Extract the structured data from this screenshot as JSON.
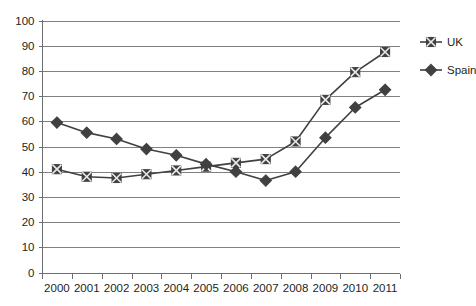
{
  "chart_data": {
    "type": "line",
    "title": "",
    "subtitle": "",
    "xlabel": "",
    "ylabel": "",
    "categories": [
      "2000",
      "2001",
      "2002",
      "2003",
      "2004",
      "2005",
      "2006",
      "2007",
      "2008",
      "2009",
      "2010",
      "2011"
    ],
    "series": [
      {
        "name": "UK",
        "marker": "square",
        "color": "#404040",
        "values": [
          41,
          38,
          37.5,
          39,
          40.5,
          42,
          43.5,
          45,
          52,
          68.5,
          79.5,
          87.5
        ]
      },
      {
        "name": "Spain",
        "marker": "diamond",
        "color": "#404040",
        "values": [
          59.5,
          55.5,
          53,
          49,
          46.5,
          43,
          40,
          36.5,
          40,
          53.5,
          65.5,
          72.5
        ]
      }
    ],
    "ylim": [
      0,
      100
    ],
    "y_ticks": [
      "0",
      "10",
      "20",
      "30",
      "40",
      "50",
      "60",
      "70",
      "80",
      "90",
      "100"
    ],
    "y_tick_values": [
      0,
      10,
      20,
      30,
      40,
      50,
      60,
      70,
      80,
      90,
      100
    ],
    "grid": true,
    "grid_axis": "y",
    "legend_position": "right",
    "legend": [
      "UK",
      "Spain"
    ],
    "annotations": []
  },
  "colors": {
    "background": "#ffffff",
    "series": "#404040",
    "gridline": "#808080",
    "axis": "#6d6e71",
    "text": "#231f20"
  }
}
